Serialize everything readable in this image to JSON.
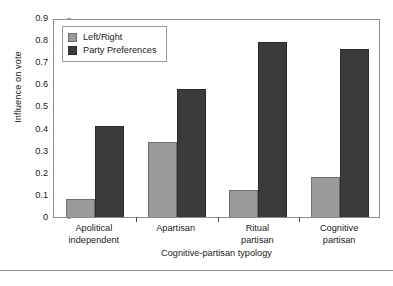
{
  "chart_data": {
    "type": "bar",
    "title": "",
    "xlabel": "Cognitive-partisan typology",
    "ylabel": "Influence on vote",
    "categories": [
      "Apolitical independent",
      "Apartisan",
      "Ritual partisan",
      "Cognitive partisan"
    ],
    "category_lines": [
      [
        "Apolitical",
        "independent"
      ],
      [
        "Apartisan"
      ],
      [
        "Ritual",
        "partisan"
      ],
      [
        "Cognitive",
        "partisan"
      ]
    ],
    "series": [
      {
        "name": "Left/Right",
        "color": "#9a9a9a",
        "values": [
          0.08,
          0.34,
          0.12,
          0.18
        ]
      },
      {
        "name": "Party Preferences",
        "color": "#3b3b3b",
        "values": [
          0.41,
          0.58,
          0.79,
          0.76
        ]
      }
    ],
    "ylim": [
      0,
      0.9
    ],
    "ytick_values": [
      0,
      0.1,
      0.2,
      0.3,
      0.4,
      0.5,
      0.6,
      0.7,
      0.8,
      0.9
    ],
    "ytick_labels": [
      "0",
      "0.1",
      "0.2",
      "0.3",
      "0.4",
      "0.5",
      "0.6",
      "0.7",
      "0.8",
      "0.9"
    ],
    "grid": false,
    "legend_position": "inside-top-left",
    "frame": true
  }
}
